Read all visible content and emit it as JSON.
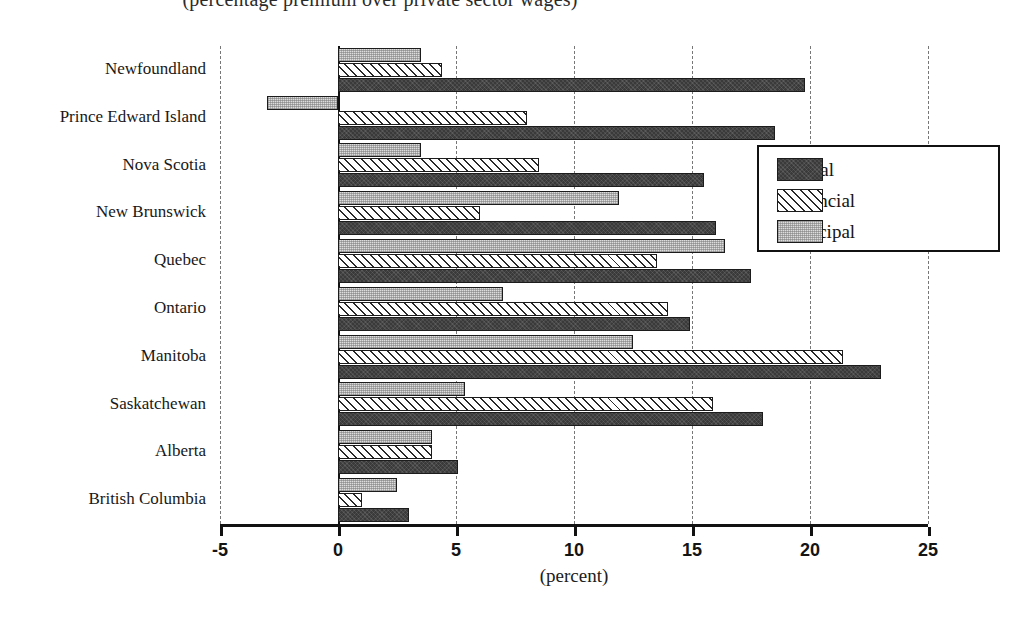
{
  "subtitle": "(percentage premium over private sector wages)",
  "x_axis_title": "(percent)",
  "legend": {
    "items": [
      {
        "label": "Federal",
        "key": "federal",
        "swatch": "dark-solid-swatch"
      },
      {
        "label": "Provincial",
        "key": "provincial",
        "swatch": "hatched-swatch"
      },
      {
        "label": "Municipal",
        "key": "municipal",
        "swatch": "stippled-swatch"
      }
    ]
  },
  "chart_data": {
    "type": "bar",
    "orientation": "horizontal",
    "title": "(percentage premium over private sector wages)",
    "xlabel": "(percent)",
    "ylabel": "",
    "xlim": [
      -5,
      25
    ],
    "xticks": [
      -5,
      0,
      5,
      10,
      15,
      20,
      25
    ],
    "xticklabels": [
      "-5",
      "0",
      "5",
      "10",
      "15",
      "20",
      "25"
    ],
    "grid": true,
    "grid_axis": "x",
    "legend_position": "right-upper",
    "categories": [
      "Newfoundland",
      "Prince Edward Island",
      "Nova Scotia",
      "New Brunswick",
      "Quebec",
      "Ontario",
      "Manitoba",
      "Saskatchewan",
      "Alberta",
      "British Columbia"
    ],
    "series": [
      {
        "name": "Federal",
        "key": "federal",
        "color": "#3a3a3a",
        "values": [
          19.8,
          18.5,
          15.5,
          16.0,
          17.5,
          14.9,
          23.0,
          18.0,
          5.1,
          3.0
        ]
      },
      {
        "name": "Provincial",
        "key": "provincial",
        "color": "#ffffff",
        "values": [
          4.4,
          8.0,
          8.5,
          6.0,
          13.5,
          14.0,
          21.4,
          15.9,
          4.0,
          1.0
        ]
      },
      {
        "name": "Municipal",
        "key": "municipal",
        "color": "#dddddd",
        "values": [
          3.5,
          -3.0,
          3.5,
          11.9,
          16.4,
          7.0,
          12.5,
          5.4,
          4.0,
          2.5
        ]
      }
    ]
  }
}
